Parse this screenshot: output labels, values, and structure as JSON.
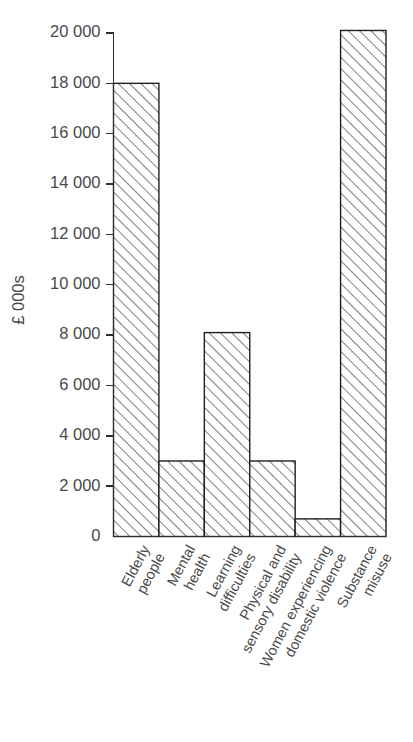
{
  "chart_data": {
    "type": "bar",
    "title": "",
    "subtitle": "",
    "xlabel": "",
    "ylabel": "£ 000s",
    "ylim": [
      0,
      20000
    ],
    "ytick_step": 2000,
    "grid": false,
    "legend": null,
    "categories": [
      "Elderly people",
      "Mental health",
      "Learning difficulties",
      "Physical and sensory disability",
      "Women experiencing domestic violence",
      "Substance misuse"
    ],
    "category_lines": [
      [
        "Elderly",
        "people"
      ],
      [
        "Mental",
        "health"
      ],
      [
        "Learning",
        "difficulties"
      ],
      [
        "Physical and",
        "sensory disability"
      ],
      [
        "Women experiencing",
        "domestic violence"
      ],
      [
        "Substance",
        "misuse"
      ]
    ],
    "values": [
      18000,
      3000,
      8100,
      3000,
      700,
      20100
    ],
    "ytick_labels": [
      "0",
      "2 000",
      "4 000",
      "6 000",
      "8 000",
      "10 000",
      "12 000",
      "14 000",
      "16 000",
      "18 000",
      "20 000"
    ],
    "ytick_values": [
      0,
      2000,
      4000,
      6000,
      8000,
      10000,
      12000,
      14000,
      16000,
      18000,
      20000
    ],
    "bar_style": {
      "fill": "#ffffff",
      "edge_color": "#1f1f1f",
      "hatch": "forward-diagonal",
      "hatch_color": "#3c3c3c"
    },
    "label_rotation_deg": 62
  }
}
